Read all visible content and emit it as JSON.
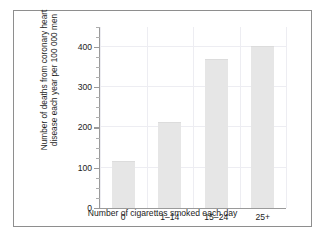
{
  "chart_data": {
    "type": "bar",
    "title": "",
    "subtitle": "",
    "categories": [
      "0",
      "1–14",
      "15–24",
      "25+"
    ],
    "values": [
      115,
      212,
      368,
      400
    ],
    "series": [
      {
        "name": "Deaths from coronary heart disease",
        "values": [
          115,
          212,
          368,
          400
        ]
      }
    ],
    "xlabel": "Number of cigarettes smoked each day",
    "ylabel": "Number of deaths from coronary heart disease each year per 100 000 men",
    "ylabel_line1": "Number of deaths from coronary heart",
    "ylabel_line2": "disease each year per 100 000 men",
    "ylim": [
      0,
      450
    ],
    "ytick_labels": [
      "0",
      "100",
      "200",
      "300",
      "400"
    ],
    "ytick_values": [
      0,
      100,
      200,
      300,
      400
    ],
    "yminor_step": 25,
    "grid": true,
    "legend": "none",
    "bar_color": "#e6e6e6",
    "axis_color": "#9a9a9a",
    "grid_color": "#ededf2",
    "text_color": "#1c1c1c",
    "frame_color": "#8e8e8e",
    "background": "#ffffff"
  }
}
